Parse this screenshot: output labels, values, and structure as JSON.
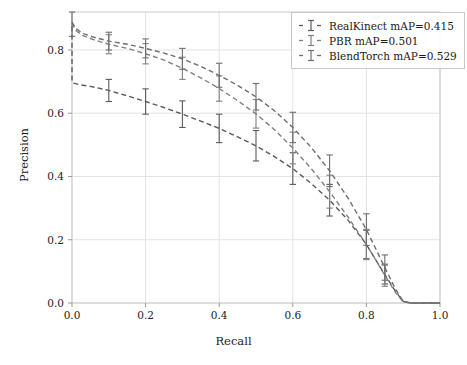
{
  "chart_data": {
    "type": "line",
    "title": "",
    "xlabel": "Recall",
    "ylabel": "Precision",
    "xlim": [
      0.0,
      1.0
    ],
    "ylim": [
      0.0,
      0.92
    ],
    "grid": true,
    "legend_position": "upper right",
    "xticks": [
      "0.0",
      "0.2",
      "0.4",
      "0.6",
      "0.8",
      "1.0"
    ],
    "xtick_values": [
      0.0,
      0.2,
      0.4,
      0.6,
      0.8,
      1.0
    ],
    "yticks": [
      "0.0",
      "0.2",
      "0.4",
      "0.6",
      "0.8"
    ],
    "ytick_values": [
      0.0,
      0.2,
      0.4,
      0.6,
      0.8
    ],
    "series": [
      {
        "name": "RealKinect mAP=0.415",
        "label": "RealKinect",
        "metric_name": "mAP",
        "metric_value": "0.415",
        "color": "#5a5a5a",
        "linestyle": "dashed",
        "x": [
          0.0,
          0.0,
          0.005,
          0.02,
          0.05,
          0.1,
          0.15,
          0.2,
          0.25,
          0.3,
          0.35,
          0.4,
          0.45,
          0.5,
          0.55,
          0.6,
          0.65,
          0.7,
          0.75,
          0.8,
          0.85,
          0.88,
          0.9,
          0.92,
          1.0
        ],
        "y": [
          0.875,
          0.7,
          0.695,
          0.69,
          0.685,
          0.672,
          0.655,
          0.637,
          0.618,
          0.597,
          0.575,
          0.552,
          0.525,
          0.497,
          0.463,
          0.425,
          0.378,
          0.325,
          0.262,
          0.185,
          0.09,
          0.035,
          0.005,
          0.0,
          0.0
        ],
        "yerr": [
          0.0,
          0.0,
          0.0,
          0.0,
          0.0,
          0.035,
          0.0,
          0.04,
          0.0,
          0.042,
          0.0,
          0.045,
          0.0,
          0.048,
          0.0,
          0.05,
          0.0,
          0.05,
          0.0,
          0.045,
          0.03,
          0.0,
          0.0,
          0.0,
          0.0
        ]
      },
      {
        "name": "PBR mAP=0.501",
        "label": "PBR",
        "metric_name": "mAP",
        "metric_value": "0.501",
        "color": "#808080",
        "linestyle": "dashed",
        "x": [
          0.0,
          0.01,
          0.03,
          0.06,
          0.1,
          0.15,
          0.2,
          0.25,
          0.3,
          0.35,
          0.4,
          0.45,
          0.5,
          0.55,
          0.6,
          0.65,
          0.7,
          0.75,
          0.8,
          0.85,
          0.88,
          0.9,
          0.92,
          1.0
        ],
        "y": [
          0.885,
          0.862,
          0.845,
          0.832,
          0.818,
          0.805,
          0.788,
          0.768,
          0.742,
          0.712,
          0.678,
          0.64,
          0.598,
          0.548,
          0.49,
          0.425,
          0.352,
          0.272,
          0.185,
          0.088,
          0.032,
          0.004,
          0.0,
          0.0
        ],
        "yerr": [
          0.0,
          0.0,
          0.0,
          0.0,
          0.03,
          0.0,
          0.032,
          0.0,
          0.035,
          0.0,
          0.04,
          0.0,
          0.045,
          0.0,
          0.05,
          0.0,
          0.052,
          0.0,
          0.048,
          0.035,
          0.0,
          0.0,
          0.0,
          0.0
        ]
      },
      {
        "name": "BlendTorch mAP=0.529",
        "label": "BlendTorch",
        "metric_name": "mAP",
        "metric_value": "0.529",
        "color": "#6e6e6e",
        "linestyle": "dashed",
        "x": [
          0.0,
          0.01,
          0.03,
          0.06,
          0.1,
          0.15,
          0.2,
          0.25,
          0.3,
          0.35,
          0.4,
          0.45,
          0.5,
          0.55,
          0.6,
          0.65,
          0.7,
          0.75,
          0.8,
          0.85,
          0.88,
          0.9,
          0.92,
          1.0
        ],
        "y": [
          0.888,
          0.868,
          0.852,
          0.84,
          0.828,
          0.818,
          0.805,
          0.79,
          0.772,
          0.748,
          0.72,
          0.688,
          0.652,
          0.608,
          0.555,
          0.492,
          0.418,
          0.332,
          0.232,
          0.112,
          0.042,
          0.006,
          0.0,
          0.0
        ],
        "yerr": [
          0.045,
          0.0,
          0.0,
          0.0,
          0.028,
          0.0,
          0.03,
          0.0,
          0.033,
          0.0,
          0.038,
          0.0,
          0.042,
          0.0,
          0.048,
          0.0,
          0.05,
          0.0,
          0.05,
          0.04,
          0.0,
          0.0,
          0.0,
          0.0
        ]
      }
    ]
  }
}
